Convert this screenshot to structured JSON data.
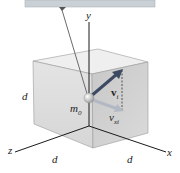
{
  "figure": {
    "type": "physics-diagram",
    "axes": {
      "x": "x",
      "y": "y",
      "z": "z"
    },
    "side_labels": [
      "d",
      "d",
      "d"
    ],
    "mass_label": "m0",
    "mass_label_main": "m",
    "mass_label_sub": "0",
    "vectors": [
      {
        "name": "initial-velocity",
        "label": "v",
        "subscript": "i",
        "color": "#3d4a63"
      },
      {
        "name": "x-velocity-component",
        "label": "v",
        "subscript": "xi",
        "color": "#a9b0bd"
      }
    ],
    "colors": {
      "ceiling": "#c9d0d6",
      "cube_front": "#dcdcdc",
      "cube_right": "#cfcfcf",
      "cube_top": "#ececec",
      "axis": "#1a1a1a",
      "string": "#6b6b6b"
    }
  }
}
